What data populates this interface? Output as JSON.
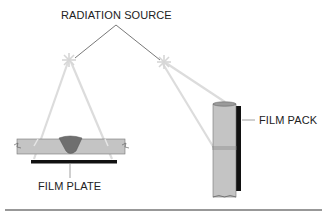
{
  "diagram": {
    "title_label": "RADIATION SOURCE",
    "left_setup": {
      "label": "FILM PLATE",
      "description": "Flat plate with butt weld, film plate beneath"
    },
    "right_setup": {
      "label": "FILM PACK",
      "description": "Pipe with circumferential weld, film pack on the far side"
    },
    "colors": {
      "plate": "#c4c4c4",
      "weld": "#6f6f6f",
      "film": "#111111",
      "beam": "#d9d9d9",
      "leader": "#555555",
      "rule": "#333333"
    }
  }
}
